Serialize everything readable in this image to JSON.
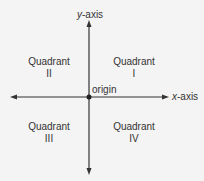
{
  "axes": {
    "y_label_var": "y",
    "y_label_suffix": "-axis",
    "x_label_var": "x",
    "x_label_suffix": "-axis",
    "origin_label": "origin"
  },
  "quadrants": [
    {
      "word": "Quadrant",
      "numeral": "I"
    },
    {
      "word": "Quadrant",
      "numeral": "II"
    },
    {
      "word": "Quadrant",
      "numeral": "III"
    },
    {
      "word": "Quadrant",
      "numeral": "IV"
    }
  ],
  "colors": {
    "line": "#333333",
    "background": "#f4f4f4"
  }
}
